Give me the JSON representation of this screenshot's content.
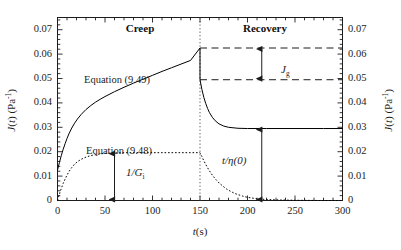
{
  "chart_data": {
    "type": "line",
    "title": "",
    "xlabel": "t(s)",
    "ylabel": "J(t) (Pa^-1)",
    "y2label": "J(t) (Pa^-1)",
    "xlim": [
      0,
      300
    ],
    "ylim": [
      0,
      0.075
    ],
    "xticks": [
      0,
      50,
      100,
      150,
      200,
      250,
      300
    ],
    "xtick_labels": [
      "0",
      "50",
      "100",
      "150",
      "200",
      "250",
      "300"
    ],
    "yticks": [
      0,
      0.01,
      0.02,
      0.03,
      0.04,
      0.05,
      0.06,
      0.07
    ],
    "ytick_labels": [
      "0",
      "0.01",
      "0.02",
      "0.03",
      "0.04",
      "0.05",
      "0.06",
      "0.07"
    ],
    "y2ticks": [
      0,
      0.01,
      0.02,
      0.03,
      0.04,
      0.05,
      0.06,
      0.07
    ],
    "y2tick_labels": [
      "0",
      "0.01",
      "0.02",
      "0.03",
      "0.04",
      "0.05",
      "0.06",
      "0.07"
    ],
    "minor_ticks_per_major": 5,
    "grid": false,
    "legend": "none",
    "creep_end_time": 150,
    "series": [
      {
        "name": "Equation (9.49)",
        "style": "solid",
        "color": "#000000",
        "points": [
          [
            0,
            0.0125
          ],
          [
            1,
            0.014
          ],
          [
            2,
            0.0155
          ],
          [
            3,
            0.017
          ],
          [
            4,
            0.0184
          ],
          [
            5,
            0.0197
          ],
          [
            6,
            0.021
          ],
          [
            8,
            0.0233
          ],
          [
            10,
            0.0254
          ],
          [
            12,
            0.0273
          ],
          [
            15,
            0.0297
          ],
          [
            18,
            0.0317
          ],
          [
            21,
            0.0334
          ],
          [
            25,
            0.0353
          ],
          [
            30,
            0.0373
          ],
          [
            35,
            0.0389
          ],
          [
            40,
            0.0403
          ],
          [
            45,
            0.0415
          ],
          [
            50,
            0.0426
          ],
          [
            60,
            0.0446
          ],
          [
            70,
            0.0464
          ],
          [
            80,
            0.0481
          ],
          [
            90,
            0.0497
          ],
          [
            100,
            0.0513
          ],
          [
            110,
            0.0529
          ],
          [
            120,
            0.0544
          ],
          [
            130,
            0.0559
          ],
          [
            140,
            0.0574
          ],
          [
            150,
            0.0625
          ],
          [
            150,
            0.0495
          ],
          [
            152,
            0.0455
          ],
          [
            154,
            0.0423
          ],
          [
            156,
            0.0398
          ],
          [
            158,
            0.0377
          ],
          [
            160,
            0.036
          ],
          [
            163,
            0.0341
          ],
          [
            166,
            0.0327
          ],
          [
            170,
            0.0314
          ],
          [
            175,
            0.0305
          ],
          [
            180,
            0.03
          ],
          [
            190,
            0.0296
          ],
          [
            200,
            0.0295
          ],
          [
            220,
            0.0295
          ],
          [
            250,
            0.0295
          ],
          [
            280,
            0.0295
          ],
          [
            300,
            0.0295
          ]
        ]
      },
      {
        "name": "Equation (9.48)",
        "style": "dotted",
        "color": "#000000",
        "points": [
          [
            0,
            0.0
          ],
          [
            1,
            0.0013
          ],
          [
            2,
            0.0026
          ],
          [
            3,
            0.0038
          ],
          [
            4,
            0.0049
          ],
          [
            5,
            0.006
          ],
          [
            6,
            0.007
          ],
          [
            8,
            0.0088
          ],
          [
            10,
            0.0104
          ],
          [
            12,
            0.0118
          ],
          [
            15,
            0.0135
          ],
          [
            18,
            0.0149
          ],
          [
            21,
            0.0159
          ],
          [
            25,
            0.0169
          ],
          [
            30,
            0.0178
          ],
          [
            35,
            0.0184
          ],
          [
            40,
            0.0188
          ],
          [
            45,
            0.0191
          ],
          [
            50,
            0.0193
          ],
          [
            60,
            0.0195
          ],
          [
            70,
            0.0196
          ],
          [
            85,
            0.0196
          ],
          [
            100,
            0.0196
          ],
          [
            120,
            0.0196
          ],
          [
            140,
            0.0196
          ],
          [
            150,
            0.0196
          ],
          [
            150,
            0.0196
          ],
          [
            152,
            0.018
          ],
          [
            154,
            0.0163
          ],
          [
            156,
            0.0148
          ],
          [
            158,
            0.0134
          ],
          [
            160,
            0.0121
          ],
          [
            163,
            0.0104
          ],
          [
            166,
            0.0089
          ],
          [
            170,
            0.0072
          ],
          [
            174,
            0.0059
          ],
          [
            178,
            0.0047
          ],
          [
            182,
            0.0038
          ],
          [
            186,
            0.003
          ],
          [
            190,
            0.0024
          ],
          [
            195,
            0.0018
          ],
          [
            200,
            0.0013
          ],
          [
            210,
            0.0007
          ],
          [
            220,
            0.0004
          ],
          [
            235,
            0.0002
          ],
          [
            250,
            0.0001
          ],
          [
            275,
            0.0
          ],
          [
            300,
            0.0
          ]
        ]
      }
    ],
    "annotations": {
      "region_creep": "Creep",
      "region_recovery": "Recovery",
      "eq_upper": "Equation (9.49)",
      "eq_lower": "Equation (9.48)",
      "measure_jg": "J",
      "measure_jg_sub": "g",
      "measure_invG": "1/G",
      "measure_invG_sub": "i",
      "measure_teta": "t/η(0)"
    },
    "guide_lines": [
      {
        "name": "creep-recovery-divider",
        "type": "vertical-dotted",
        "x": 150
      },
      {
        "name": "upper-dashed-level",
        "type": "horizontal-dashed",
        "y": 0.0625,
        "x_from": 150,
        "x_to": 300
      },
      {
        "name": "lower-dashed-level",
        "type": "horizontal-dashed",
        "y": 0.0495,
        "x_from": 150,
        "x_to": 300
      }
    ],
    "arrows": [
      {
        "name": "jg-arrow",
        "x": 215,
        "y_from": 0.0495,
        "y_to": 0.0625
      },
      {
        "name": "inv-gi-arrow",
        "x": 60,
        "y_from": 0.0,
        "y_to": 0.0196
      },
      {
        "name": "t-eta-arrow",
        "x": 215,
        "y_from": 0.0,
        "y_to": 0.0295
      }
    ]
  },
  "colors": {
    "background": "#ffffff",
    "axis": "#1d1d1d",
    "curve": "#000000",
    "text": "#1d1d1d"
  }
}
